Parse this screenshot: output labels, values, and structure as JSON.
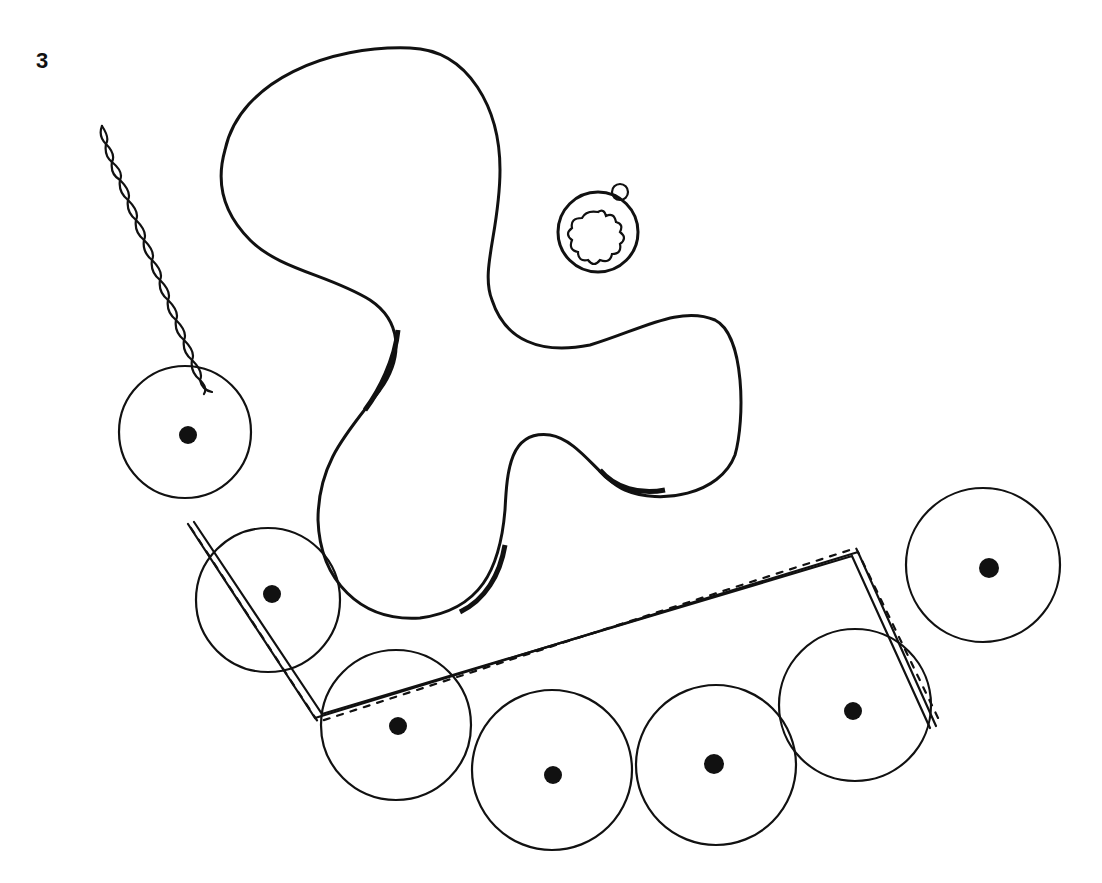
{
  "figure": {
    "label": "3",
    "background": "#ffffff",
    "ink_color": "#111111"
  },
  "elements": {
    "large_cell": {
      "type": "amoeboid-cell",
      "stippled": true
    },
    "small_organism": {
      "type": "round-body-with-lobed-interior"
    },
    "round_cells": [
      {
        "id": 1,
        "cx": 185,
        "cy": 432,
        "r": 66
      },
      {
        "id": 2,
        "cx": 268,
        "cy": 600,
        "r": 72
      },
      {
        "id": 3,
        "cx": 396,
        "cy": 725,
        "r": 75
      },
      {
        "id": 4,
        "cx": 552,
        "cy": 770,
        "r": 80
      },
      {
        "id": 5,
        "cx": 716,
        "cy": 765,
        "r": 80
      },
      {
        "id": 6,
        "cx": 855,
        "cy": 705,
        "r": 76
      },
      {
        "id": 7,
        "cx": 983,
        "cy": 565,
        "r": 77
      }
    ],
    "strands": [
      {
        "id": "strand-upper-left"
      },
      {
        "id": "strand-lower-chain"
      }
    ]
  }
}
